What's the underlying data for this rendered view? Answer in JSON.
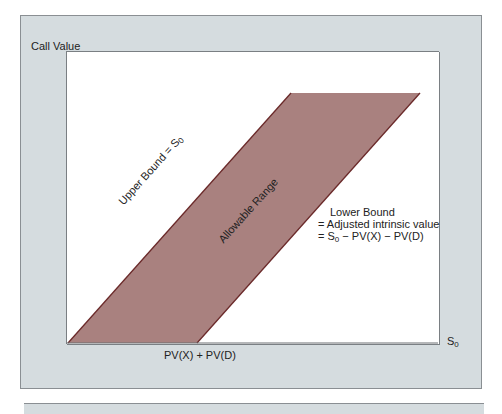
{
  "diagram": {
    "y_axis_label": "Call Value",
    "x_axis_label": "S",
    "x_axis_label_sub": "0",
    "x_intercept_label": "PV(X) + PV(D)",
    "upper_bound_label": "Upper Bound = S",
    "upper_bound_sub": "0",
    "region_label": "Allowable Range",
    "lower_bound": {
      "line1": "Lower Bound",
      "line2": "= Adjusted intrinsic value",
      "line3_prefix": "= S",
      "line3_sub": "0",
      "line3_suffix": " − PV(X) − PV(D)"
    },
    "colors": {
      "panel_bg": "#d5dcdf",
      "plot_bg": "#ffffff",
      "region_fill": "#a9817f",
      "bound_line": "#6b2a2a"
    }
  }
}
